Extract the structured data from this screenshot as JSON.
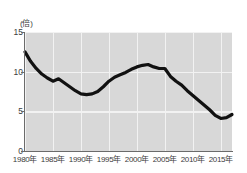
{
  "chart_data": {
    "type": "line",
    "title": "",
    "subtitle": "",
    "xlabel": "",
    "ylabel": "(倍)",
    "yunit": "倍",
    "xlim": [
      1980,
      2017
    ],
    "ylim": [
      0,
      15
    ],
    "grid": true,
    "legend": false,
    "legend_position": "none",
    "y_ticks": [
      15,
      10,
      5,
      0
    ],
    "y_tick_labels": [
      "15",
      "10",
      "5",
      "0"
    ],
    "x_ticks": [
      1980,
      1985,
      1990,
      1995,
      2000,
      2005,
      2010,
      2015
    ],
    "x_tick_labels": [
      "1980年",
      "1985年",
      "1990年",
      "1995年",
      "2000年",
      "2005年",
      "2010年",
      "2015年"
    ],
    "colors": {
      "line": "#111111",
      "plot_background": "#d8d8d8",
      "gridline": "#f2f2f2",
      "axis": "#6b6b6b",
      "text": "#3c3c3c",
      "page_background": "#ffffff"
    },
    "line_width_px": 3.2,
    "series": [
      {
        "name": "倍率",
        "color": "#111111",
        "x": [
          1980,
          1981,
          1982,
          1983,
          1984,
          1985,
          1986,
          1987,
          1988,
          1989,
          1990,
          1991,
          1992,
          1993,
          1994,
          1995,
          1996,
          1997,
          1998,
          1999,
          2000,
          2001,
          2002,
          2003,
          2004,
          2005,
          2006,
          2007,
          2008,
          2009,
          2010,
          2011,
          2012,
          2013,
          2014,
          2015,
          2016,
          2017
        ],
        "values": [
          12.5,
          11.3,
          10.4,
          9.7,
          9.2,
          8.8,
          9.1,
          8.6,
          8.1,
          7.6,
          7.2,
          7.1,
          7.2,
          7.5,
          8.1,
          8.8,
          9.3,
          9.6,
          9.9,
          10.3,
          10.6,
          10.8,
          10.9,
          10.6,
          10.4,
          10.4,
          9.4,
          8.8,
          8.3,
          7.6,
          7.0,
          6.4,
          5.8,
          5.2,
          4.5,
          4.1,
          4.2,
          4.6
        ]
      }
    ]
  }
}
